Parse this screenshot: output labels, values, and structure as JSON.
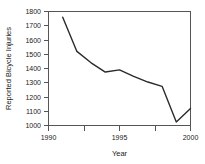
{
  "chart_data": {
    "type": "line",
    "title": "",
    "xlabel": "Year",
    "ylabel": "Reported Bicycle Injuries",
    "x": [
      1991,
      1992,
      1993,
      1994,
      1995,
      1996,
      1997,
      1998,
      1999,
      2000
    ],
    "values": [
      1760,
      1520,
      1440,
      1375,
      1390,
      1345,
      1305,
      1275,
      1025,
      1120
    ],
    "series": [
      {
        "name": "Reported Bicycle Injuries",
        "values": [
          1760,
          1520,
          1440,
          1375,
          1390,
          1345,
          1305,
          1275,
          1025,
          1120
        ]
      }
    ],
    "xlim": [
      1990,
      2000
    ],
    "ylim": [
      1000,
      1800
    ],
    "x_ticks": [
      1990,
      1992.5,
      1995,
      1997.5,
      2000
    ],
    "x_tick_labels": [
      "1990",
      "",
      "1995",
      "",
      "2000"
    ],
    "y_ticks": [
      1000,
      1100,
      1200,
      1300,
      1400,
      1500,
      1600,
      1700,
      1800
    ],
    "y_tick_labels": [
      "1000",
      "1100",
      "1200",
      "1300",
      "1400",
      "1500",
      "1600",
      "1700",
      "1800"
    ],
    "grid": false,
    "legend": false,
    "legend_position": "none",
    "line_color": "#2b2b2b",
    "axis_color": "#555555"
  },
  "axis": {
    "x_title": "Year",
    "y_title": "Reported Bicycle Injuries"
  },
  "y_labels": {
    "t1800": "1800",
    "t1700": "1700",
    "t1600": "1600",
    "t1500": "1500",
    "t1400": "1400",
    "t1300": "1300",
    "t1200": "1200",
    "t1100": "1100",
    "t1000": "1000"
  },
  "x_labels": {
    "t1990": "1990",
    "t1995": "1995",
    "t2000": "2000"
  }
}
